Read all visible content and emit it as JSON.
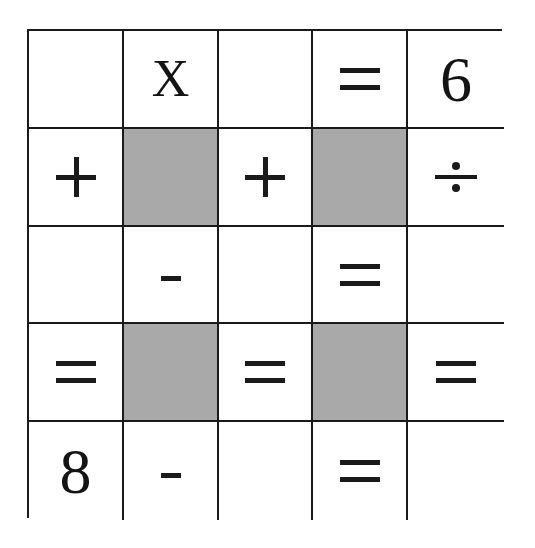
{
  "puzzle": {
    "rows": 5,
    "cols": 5,
    "shade_color": "#a9a9a9",
    "cells": [
      [
        {
          "type": "blank",
          "value": ""
        },
        {
          "type": "letter",
          "value": "X"
        },
        {
          "type": "blank",
          "value": ""
        },
        {
          "type": "equals",
          "value": "="
        },
        {
          "type": "number",
          "value": "6"
        }
      ],
      [
        {
          "type": "plus",
          "value": "+"
        },
        {
          "type": "shaded",
          "value": ""
        },
        {
          "type": "plus",
          "value": "+"
        },
        {
          "type": "shaded",
          "value": ""
        },
        {
          "type": "divide",
          "value": "÷"
        }
      ],
      [
        {
          "type": "blank",
          "value": ""
        },
        {
          "type": "minus",
          "value": "-"
        },
        {
          "type": "blank",
          "value": ""
        },
        {
          "type": "equals",
          "value": "="
        },
        {
          "type": "blank",
          "value": ""
        }
      ],
      [
        {
          "type": "equals",
          "value": "="
        },
        {
          "type": "shaded",
          "value": ""
        },
        {
          "type": "equals",
          "value": "="
        },
        {
          "type": "shaded",
          "value": ""
        },
        {
          "type": "equals",
          "value": "="
        }
      ],
      [
        {
          "type": "number",
          "value": "8"
        },
        {
          "type": "minus",
          "value": "-"
        },
        {
          "type": "blank",
          "value": ""
        },
        {
          "type": "equals",
          "value": "="
        },
        {
          "type": "blank",
          "value": ""
        }
      ]
    ]
  }
}
